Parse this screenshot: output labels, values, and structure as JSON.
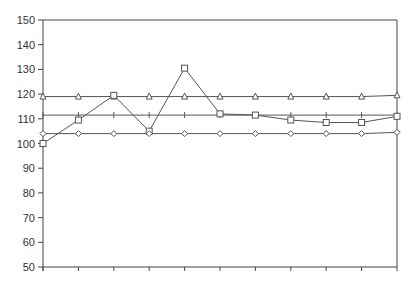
{
  "chart_data": {
    "type": "line",
    "title": "",
    "xlabel": "",
    "ylabel": "",
    "ylim": [
      50,
      150
    ],
    "yticks": [
      50,
      60,
      70,
      80,
      90,
      100,
      110,
      120,
      130,
      140,
      150
    ],
    "x": [
      0,
      1,
      2,
      3,
      4,
      5,
      6,
      7,
      8,
      9,
      10
    ],
    "xtick_labels": [],
    "grid": false,
    "legend": null,
    "series": [
      {
        "name": "triangle",
        "marker": "triangle",
        "values": [
          119,
          119,
          119,
          119,
          119,
          119,
          119,
          119,
          119,
          119,
          119.5
        ]
      },
      {
        "name": "plus",
        "marker": "plus",
        "values": [
          111.5,
          111.5,
          111.5,
          111.5,
          111.5,
          111.5,
          111.5,
          111.5,
          111.5,
          111.5,
          111.5
        ]
      },
      {
        "name": "square",
        "marker": "square",
        "values": [
          100,
          109.5,
          119.5,
          105,
          130.5,
          112,
          111.5,
          109.5,
          108.5,
          108.5,
          111
        ]
      },
      {
        "name": "diamond",
        "marker": "diamond",
        "values": [
          104,
          104,
          104,
          104,
          104,
          104,
          104,
          104,
          104,
          104,
          104.5
        ]
      }
    ]
  },
  "colors": {
    "line": "#555555",
    "axis": "#444444",
    "text": "#333333"
  }
}
